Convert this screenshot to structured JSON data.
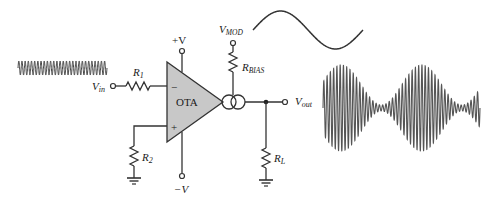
{
  "diagram": {
    "labels": {
      "vin": {
        "main": "V",
        "sub": "in"
      },
      "r1": {
        "main": "R",
        "sub": "1"
      },
      "r2": {
        "main": "R",
        "sub": "2"
      },
      "rbias": {
        "main": "R",
        "sub": "BIAS"
      },
      "rl": {
        "main": "R",
        "sub": "L"
      },
      "vmod": {
        "main": "V",
        "sub": "MOD"
      },
      "vout": {
        "main": "V",
        "sub": "out"
      },
      "plus_v": "+V",
      "minus_v": "−V",
      "ota": "OTA",
      "inverting": "−",
      "noninverting": "+"
    },
    "colors": {
      "wire": "#333333",
      "ota_fill": "#c8c8c8",
      "waveform": "#444444",
      "background": "#ffffff"
    },
    "waveforms": {
      "input_carrier": {
        "cycles": 28,
        "description": "constant amplitude carrier"
      },
      "modulating_signal": {
        "cycles": 1,
        "description": "one sine period"
      },
      "output_am": {
        "cycles": 48,
        "description": "amplitude modulated output, two envelope peaks"
      }
    }
  }
}
